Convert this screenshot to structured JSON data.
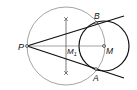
{
  "diagram": {
    "type": "geometric-construction",
    "points": {
      "P": {
        "label": "P",
        "x": 27,
        "y": 46
      },
      "M": {
        "label": "M",
        "x": 104,
        "y": 46
      },
      "M1": {
        "label": "M",
        "sub": "1",
        "x": 66,
        "y": 46
      },
      "A": {
        "label": "A",
        "x": 96,
        "y": 69
      },
      "B": {
        "label": "B",
        "x": 96,
        "y": 23
      }
    },
    "circles": {
      "thales": {
        "cx": 66,
        "cy": 46,
        "r": 39
      },
      "main": {
        "cx": 104,
        "cy": 46,
        "r": 25
      }
    },
    "colors": {
      "stroke": "#111111",
      "thin": "#555555",
      "background": "#ffffff"
    }
  }
}
